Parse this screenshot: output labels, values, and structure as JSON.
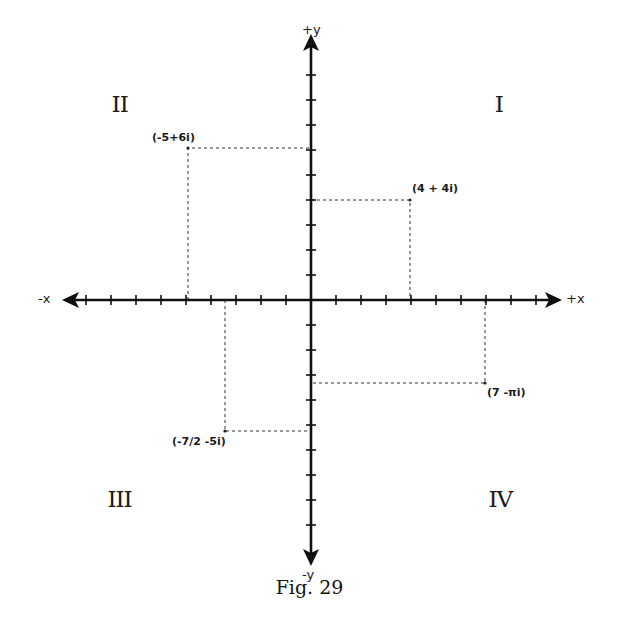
{
  "figure": {
    "caption": "Fig. 29",
    "axes": {
      "pos_x_label": "+x",
      "neg_x_label": "-x",
      "pos_y_label": "+y",
      "neg_y_label": "-y",
      "origin_px": [
        311,
        300
      ],
      "unit_px": 25,
      "x_ticks": [
        -9,
        -8,
        -7,
        -6,
        -5,
        -4,
        -3,
        -2,
        -1,
        1,
        2,
        3,
        4,
        5,
        6,
        7,
        8,
        9
      ],
      "y_ticks": [
        -9,
        -8,
        -7,
        -6,
        -5,
        -4,
        -3,
        -2,
        -1,
        1,
        2,
        3,
        4,
        5,
        6,
        7,
        8,
        9
      ]
    },
    "quadrants": [
      {
        "id": "I",
        "label": "I"
      },
      {
        "id": "II",
        "label": "II"
      },
      {
        "id": "III",
        "label": "III"
      },
      {
        "id": "IV",
        "label": "IV"
      }
    ],
    "points": [
      {
        "label": "(-5+6i)",
        "re": -5,
        "im": 6
      },
      {
        "label": "(4 + 4i)",
        "re": 4,
        "im": 4
      },
      {
        "label": "(7 -πi)",
        "re": 7,
        "im": -3.1416
      },
      {
        "label": "(-7/2 -5i)",
        "re": -3.5,
        "im": -5
      }
    ],
    "colors": {
      "ink": "#1a1a1a",
      "background": "#ffffff"
    }
  }
}
